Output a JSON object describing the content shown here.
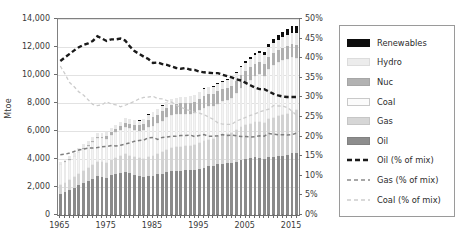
{
  "chart_data": {
    "type": "bar",
    "title": "",
    "xlabel": "",
    "ylabel": "Mtoe",
    "ylabel_right": "",
    "ylim": [
      0,
      14000
    ],
    "ylim_right": [
      0,
      0.5
    ],
    "grid": true,
    "legend_position": "right",
    "x": [
      1965,
      1966,
      1967,
      1968,
      1969,
      1970,
      1971,
      1972,
      1973,
      1974,
      1975,
      1976,
      1977,
      1978,
      1979,
      1980,
      1981,
      1982,
      1983,
      1984,
      1985,
      1986,
      1987,
      1988,
      1989,
      1990,
      1991,
      1992,
      1993,
      1994,
      1995,
      1996,
      1997,
      1998,
      1999,
      2000,
      2001,
      2002,
      2003,
      2004,
      2005,
      2006,
      2007,
      2008,
      2009,
      2010,
      2011,
      2012,
      2013,
      2014,
      2015,
      2016
    ],
    "x_tick_labels": [
      "1965",
      "1975",
      "1985",
      "1995",
      "2005",
      "2015"
    ],
    "x_tick_values": [
      1965,
      1975,
      1985,
      1995,
      2005,
      2015
    ],
    "y_tick_labels": [
      "0",
      "2,000",
      "4,000",
      "6,000",
      "8,000",
      "10,000",
      "12,000",
      "14,000"
    ],
    "y_tick_values": [
      0,
      2000,
      4000,
      6000,
      8000,
      10000,
      12000,
      14000
    ],
    "y_tick_labels_right": [
      "0%",
      "5%",
      "10%",
      "15%",
      "20%",
      "25%",
      "30%",
      "35%",
      "40%",
      "45%",
      "50%"
    ],
    "y_tick_values_right": [
      0,
      0.05,
      0.1,
      0.15,
      0.2,
      0.25,
      0.3,
      0.35,
      0.4,
      0.45,
      0.5
    ],
    "stacked": true,
    "stack_order_bottom_to_top": [
      "Oil",
      "Gas",
      "Coal",
      "Nuc",
      "Hydro",
      "Renewables"
    ],
    "series": [
      {
        "name": "Oil",
        "color": "#8a8a8a",
        "values": [
          1530,
          1670,
          1790,
          1940,
          2110,
          2270,
          2400,
          2570,
          2760,
          2720,
          2660,
          2840,
          2930,
          3030,
          3100,
          2970,
          2840,
          2760,
          2730,
          2790,
          2790,
          2900,
          2960,
          3060,
          3110,
          3150,
          3160,
          3200,
          3190,
          3250,
          3300,
          3390,
          3470,
          3510,
          3610,
          3660,
          3690,
          3720,
          3820,
          3960,
          4030,
          4070,
          4120,
          4100,
          4030,
          4130,
          4170,
          4220,
          4250,
          4320,
          4400,
          4420
        ]
      },
      {
        "name": "Gas",
        "color": "#d2d2d2",
        "values": [
          600,
          640,
          690,
          750,
          820,
          880,
          940,
          990,
          1040,
          1050,
          1050,
          1120,
          1150,
          1200,
          1260,
          1270,
          1280,
          1280,
          1290,
          1380,
          1420,
          1440,
          1520,
          1590,
          1650,
          1690,
          1720,
          1730,
          1750,
          1760,
          1830,
          1910,
          1920,
          1950,
          2010,
          2090,
          2110,
          2160,
          2230,
          2310,
          2390,
          2440,
          2530,
          2580,
          2520,
          2730,
          2780,
          2840,
          2890,
          2930,
          3000,
          3070
        ]
      },
      {
        "name": "Coal",
        "color": "#f3f3f3",
        "values": [
          1480,
          1490,
          1470,
          1510,
          1550,
          1600,
          1610,
          1630,
          1690,
          1700,
          1730,
          1790,
          1840,
          1860,
          1950,
          1970,
          1970,
          1990,
          2030,
          2110,
          2180,
          2210,
          2270,
          2330,
          2360,
          2350,
          2330,
          2300,
          2290,
          2300,
          2340,
          2380,
          2390,
          2360,
          2340,
          2370,
          2410,
          2450,
          2650,
          2820,
          2980,
          3120,
          3270,
          3360,
          3350,
          3540,
          3760,
          3850,
          3910,
          3930,
          3880,
          3730
        ]
      },
      {
        "name": "Nuc",
        "color": "#b0b0b0",
        "values": [
          20,
          25,
          30,
          35,
          45,
          55,
          70,
          90,
          110,
          130,
          170,
          190,
          230,
          260,
          260,
          290,
          350,
          370,
          430,
          520,
          600,
          630,
          670,
          700,
          720,
          740,
          760,
          760,
          780,
          790,
          810,
          830,
          840,
          850,
          880,
          880,
          890,
          900,
          890,
          910,
          910,
          910,
          900,
          900,
          890,
          900,
          880,
          870,
          880,
          900,
          920,
          940
        ]
      },
      {
        "name": "Hydro",
        "color": "#e8e8e8",
        "values": [
          190,
          200,
          210,
          220,
          230,
          240,
          250,
          260,
          270,
          280,
          290,
          290,
          300,
          320,
          330,
          340,
          350,
          350,
          370,
          380,
          390,
          400,
          400,
          410,
          420,
          430,
          440,
          440,
          460,
          470,
          490,
          500,
          500,
          510,
          520,
          530,
          520,
          530,
          540,
          570,
          580,
          590,
          610,
          630,
          650,
          700,
          720,
          740,
          770,
          790,
          810,
          830
        ]
      },
      {
        "name": "Renewables",
        "color": "#0d0d0d",
        "values": [
          2,
          2,
          3,
          3,
          3,
          4,
          4,
          5,
          5,
          5,
          6,
          6,
          7,
          7,
          8,
          9,
          9,
          10,
          11,
          12,
          13,
          14,
          15,
          17,
          18,
          20,
          22,
          24,
          27,
          30,
          34,
          38,
          42,
          47,
          52,
          58,
          64,
          72,
          81,
          92,
          106,
          124,
          146,
          172,
          192,
          230,
          272,
          314,
          360,
          410,
          460,
          510
        ]
      }
    ],
    "pct_series": [
      {
        "name": "Oil (% of mix)",
        "color": "#1a1a1a",
        "style": "dashed-bold",
        "axis": "right",
        "values": [
          0.393,
          0.402,
          0.411,
          0.42,
          0.428,
          0.434,
          0.438,
          0.444,
          0.456,
          0.45,
          0.444,
          0.448,
          0.448,
          0.45,
          0.445,
          0.43,
          0.418,
          0.411,
          0.404,
          0.398,
          0.388,
          0.389,
          0.385,
          0.383,
          0.379,
          0.375,
          0.373,
          0.375,
          0.371,
          0.37,
          0.366,
          0.364,
          0.363,
          0.362,
          0.362,
          0.358,
          0.354,
          0.351,
          0.346,
          0.343,
          0.337,
          0.331,
          0.325,
          0.321,
          0.321,
          0.315,
          0.309,
          0.305,
          0.302,
          0.301,
          0.301,
          0.301
        ]
      },
      {
        "name": "Gas (% of mix)",
        "color": "#7e7e7e",
        "style": "dashed",
        "axis": "right",
        "values": [
          0.154,
          0.155,
          0.158,
          0.162,
          0.166,
          0.168,
          0.171,
          0.171,
          0.172,
          0.174,
          0.175,
          0.177,
          0.176,
          0.178,
          0.181,
          0.184,
          0.188,
          0.19,
          0.191,
          0.197,
          0.198,
          0.193,
          0.198,
          0.199,
          0.201,
          0.201,
          0.203,
          0.203,
          0.204,
          0.2,
          0.203,
          0.205,
          0.201,
          0.201,
          0.202,
          0.205,
          0.203,
          0.204,
          0.202,
          0.2,
          0.2,
          0.199,
          0.2,
          0.202,
          0.201,
          0.208,
          0.206,
          0.205,
          0.205,
          0.204,
          0.205,
          0.209
        ]
      },
      {
        "name": "Coal (% of mix)",
        "color": "#cccccc",
        "style": "dashed-light",
        "axis": "right",
        "values": [
          0.38,
          0.36,
          0.338,
          0.327,
          0.314,
          0.306,
          0.294,
          0.282,
          0.279,
          0.281,
          0.289,
          0.283,
          0.281,
          0.276,
          0.28,
          0.285,
          0.29,
          0.296,
          0.3,
          0.301,
          0.303,
          0.297,
          0.296,
          0.292,
          0.288,
          0.28,
          0.275,
          0.27,
          0.266,
          0.262,
          0.26,
          0.256,
          0.25,
          0.244,
          0.235,
          0.232,
          0.231,
          0.231,
          0.24,
          0.244,
          0.249,
          0.254,
          0.258,
          0.263,
          0.267,
          0.27,
          0.279,
          0.278,
          0.278,
          0.274,
          0.265,
          0.254
        ]
      }
    ]
  },
  "legend": {
    "items": [
      {
        "label": "Renewables",
        "swatch": "#0d0d0d",
        "kind": "swatch",
        "border": "#0d0d0d"
      },
      {
        "label": "Hydro",
        "swatch": "#ececec",
        "kind": "swatch",
        "border": "#dcdcdc"
      },
      {
        "label": "Nuc",
        "swatch": "#b2b2b2",
        "kind": "swatch",
        "border": "#a6a6a6"
      },
      {
        "label": "Coal",
        "swatch": "#fbfbfb",
        "kind": "swatch",
        "border": "#c9c9c9"
      },
      {
        "label": "Gas",
        "swatch": "#d6d6d6",
        "kind": "swatch",
        "border": "#c6c6c6"
      },
      {
        "label": "Oil",
        "swatch": "#8d8d8d",
        "kind": "swatch",
        "border": "#818181"
      },
      {
        "label": "Oil (% of mix)",
        "swatch": "#1a1a1a",
        "kind": "line",
        "dash": "5,3",
        "width": 2.4
      },
      {
        "label": "Gas (% of mix)",
        "swatch": "#8a8a8a",
        "kind": "line",
        "dash": "4,3",
        "width": 1.5
      },
      {
        "label": "Coal (% of mix)",
        "swatch": "#cdcdcd",
        "kind": "line",
        "dash": "4,3",
        "width": 1.4
      }
    ]
  },
  "axes": {
    "y_left_title": "Mtoe"
  }
}
